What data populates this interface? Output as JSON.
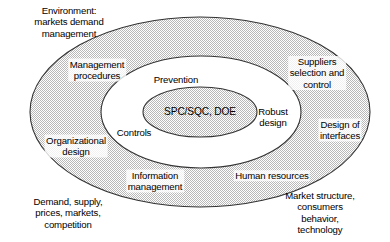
{
  "diagram": {
    "type": "concentric-ellipse-venn",
    "title": "",
    "colors": {
      "ring_fill": "#d4d4d4",
      "ring_stroke": "#3a3a3a",
      "core_fill": "#d4d4d4",
      "middle_fill": "#ffffff",
      "text": "#000000",
      "background": "#ffffff"
    },
    "rings": [
      {
        "name": "outer-environment-ring",
        "rx": 171,
        "ry": 96,
        "fill": "stippled-gray"
      },
      {
        "name": "middle-ring",
        "rx": 100,
        "ry": 56,
        "fill": "white"
      },
      {
        "name": "inner-core-ellipse",
        "rx": 57,
        "ry": 25,
        "fill": "stippled-gray"
      }
    ],
    "core": {
      "label": "SPC/SQC, DOE"
    },
    "middle_ring_labels": [
      {
        "id": "prevention",
        "text": "Prevention",
        "x": 176,
        "y": 80
      },
      {
        "id": "robust-design",
        "text": "Robust\ndesign",
        "x": 273,
        "y": 117
      },
      {
        "id": "controls",
        "text": "Controls",
        "x": 134,
        "y": 133
      }
    ],
    "outer_ring_labels": [
      {
        "id": "management-procedures",
        "text": "Management\nprocedures",
        "x": 97,
        "y": 70
      },
      {
        "id": "suppliers-selection-and-control",
        "text": "Suppliers\nselection and\ncontrol",
        "x": 317,
        "y": 73
      },
      {
        "id": "design-of-interfaces",
        "text": "Design of\ninterfaces",
        "x": 340,
        "y": 130
      },
      {
        "id": "organizational-design",
        "text": "Organizational\ndesign",
        "x": 76,
        "y": 146
      },
      {
        "id": "information-management",
        "text": "Information\nmanagement",
        "x": 155,
        "y": 181
      },
      {
        "id": "human-resources",
        "text": "Human resources",
        "x": 272,
        "y": 176
      }
    ],
    "external_labels": [
      {
        "id": "environment-markets-demand-management",
        "text": "Environment:\nmarkets demand\nmanagement",
        "x": 69,
        "y": 22
      },
      {
        "id": "demand-supply-prices-markets-competition",
        "text": "Demand, supply,\nprices, markets,\ncompetition",
        "x": 68,
        "y": 213
      },
      {
        "id": "market-structure-consumers-behavior-technology",
        "text": "Market structure,\nconsumers behavior,\ntechnology",
        "x": 320,
        "y": 213
      }
    ]
  }
}
